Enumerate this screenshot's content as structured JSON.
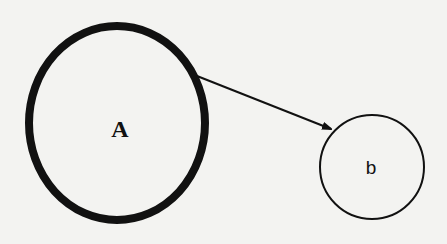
{
  "diagram": {
    "nodes": [
      {
        "id": "A",
        "label": "A",
        "style": "thick-border",
        "cx": 117,
        "cy": 123,
        "rx": 88,
        "ry": 97
      },
      {
        "id": "b",
        "label": "b",
        "style": "thin-border",
        "cx": 372,
        "cy": 167,
        "rx": 52,
        "ry": 52
      }
    ],
    "edges": [
      {
        "from": "A",
        "to": "b",
        "directed": true
      }
    ],
    "colors": {
      "background": "#f3f3f1",
      "stroke": "#111111"
    }
  }
}
